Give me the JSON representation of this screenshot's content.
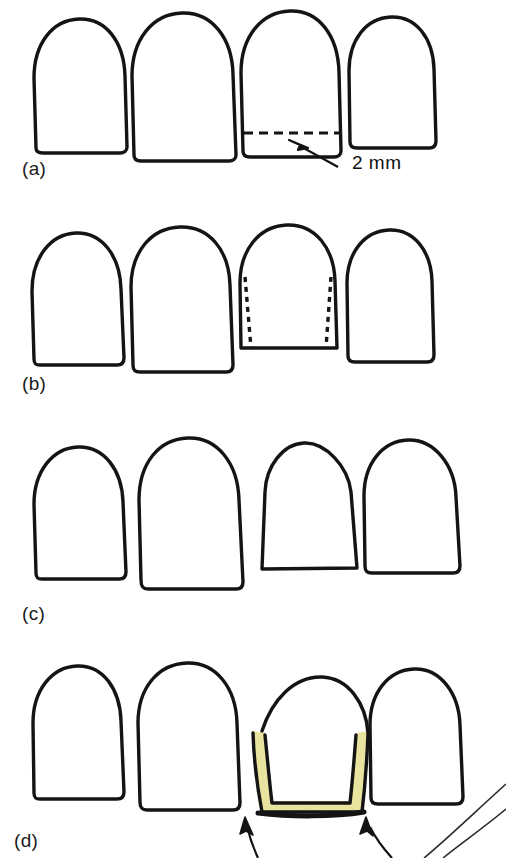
{
  "figure": {
    "width": 506,
    "height": 858,
    "background_color": "#ffffff",
    "ink_color": "#141414",
    "highlight_color": "#e9e3a0",
    "type": "line-drawing-diagram"
  },
  "panels": [
    {
      "id": "panel-a",
      "label": "(a)",
      "label_x": 22,
      "label_y": 158,
      "teeth": 4,
      "annotation": {
        "text": "2 mm",
        "x": 352,
        "y": 150,
        "target": "incisal reduction line on third tooth",
        "marker": "dashed-horizontal-line-with-arrow"
      },
      "description": "Third tooth has a horizontal dashed line near the incisal edge marking a 2 mm incisal reduction; a leader line with a solid arrowhead points to the zone below the dashed line."
    },
    {
      "id": "panel-b",
      "label": "(b)",
      "label_x": 22,
      "label_y": 373,
      "teeth": 4,
      "annotation": null,
      "description": "Third tooth is shortened; vertical dashed lines on its mesial and distal aspects show the planned proximal axial reduction."
    },
    {
      "id": "panel-c",
      "label": "(c)",
      "label_x": 22,
      "label_y": 603,
      "teeth": 4,
      "annotation": null,
      "description": "Third tooth is fully prepared: narrower, shorter and tapered with rounded incisal corners, no dashed guide lines remain."
    },
    {
      "id": "panel-d",
      "label": "(d)",
      "label_x": 14,
      "label_y": 830,
      "teeth": 4,
      "annotation": {
        "text": "",
        "marker": "two-curved-arrows-pointing-to-restoration-margins"
      },
      "description": "Third tooth carries a pale yellow restoration shell over the prepared surfaces; two curved arrows point up to the margins, and two thin curved reference lines appear at the lower right."
    }
  ],
  "labels": {
    "a": "(a)",
    "b": "(b)",
    "c": "(c)",
    "d": "(d)",
    "measurement": "2 mm"
  },
  "icons": {
    "arrowhead": "solid-triangle-arrowhead-icon",
    "dashed_guide": "dashed-guide-line-icon",
    "highlight_band": "yellow-highlight-band-icon"
  }
}
